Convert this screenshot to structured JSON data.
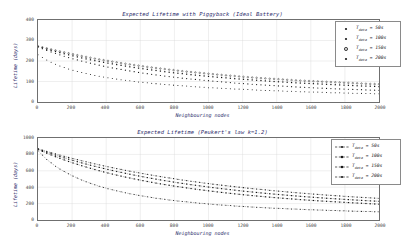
{
  "figure": {
    "background": "#ffffff",
    "axis_color": "#6f6f6f",
    "title_color": "#2b2b6b",
    "marker_color": "#1a1a1a"
  },
  "panels": [
    {
      "id": "top",
      "title": "Expected Lifetime with Piggyback (Ideal Battery)",
      "xlabel": "Neighbouring nodes",
      "ylabel": "Lifetime (days)",
      "yticks": [
        "400",
        "300",
        "200",
        "100",
        "0"
      ],
      "xticks": [
        "0",
        "200",
        "400",
        "600",
        "800",
        "1000",
        "1200",
        "1400",
        "1600",
        "1800",
        "2000"
      ],
      "legend": [
        {
          "label": "T",
          "sub": "data",
          "value": "= 50s",
          "style": "marker"
        },
        {
          "label": "T",
          "sub": "data",
          "value": "= 100s",
          "style": "marker"
        },
        {
          "label": "T",
          "sub": "data",
          "value": "= 150s",
          "style": "marker"
        },
        {
          "label": "T",
          "sub": "data",
          "value": "= 200s",
          "style": "marker"
        }
      ]
    },
    {
      "id": "bottom",
      "title": "Expected Lifetime (Peukert's law k=1.2)",
      "xlabel": "Neighbouring nodes",
      "ylabel": "Lifetime (days)",
      "yticks": [
        "1000",
        "800",
        "600",
        "400",
        "200",
        "0"
      ],
      "xticks": [
        "0",
        "200",
        "400",
        "600",
        "800",
        "1000",
        "1200",
        "1400",
        "1600",
        "1800",
        "2000"
      ],
      "legend": [
        {
          "label": "T",
          "sub": "data",
          "value": "= 50s",
          "style": "dashed-marker"
        },
        {
          "label": "T",
          "sub": "data",
          "value": "= 100s",
          "style": "dashed-marker"
        },
        {
          "label": "T",
          "sub": "data",
          "value": "= 150s",
          "style": "dashed-marker"
        },
        {
          "label": "T",
          "sub": "data",
          "value": "= 200s",
          "style": "dashed-marker"
        }
      ]
    }
  ],
  "chart_data": [
    {
      "type": "scatter",
      "title": "Expected Lifetime with Piggyback (Ideal Battery)",
      "xlabel": "Neighbouring nodes",
      "ylabel": "Lifetime (days)",
      "xlim": [
        0,
        2000
      ],
      "ylim": [
        0,
        400
      ],
      "xticks": [
        0,
        200,
        400,
        600,
        800,
        1000,
        1200,
        1400,
        1600,
        1800,
        2000
      ],
      "yticks": [
        0,
        100,
        200,
        300,
        400
      ],
      "grid": true,
      "legend_position": "upper right",
      "x": [
        0,
        50,
        100,
        150,
        200,
        250,
        300,
        350,
        400,
        450,
        500,
        550,
        600,
        650,
        700,
        750,
        800,
        850,
        900,
        950,
        1000,
        1050,
        1100,
        1150,
        1200,
        1250,
        1300,
        1350,
        1400,
        1450,
        1500,
        1550,
        1600,
        1650,
        1700,
        1750,
        1800,
        1850,
        1900,
        1950,
        2000
      ],
      "series": [
        {
          "name": "T_data = 50s",
          "values": [
            268,
            252,
            238,
            224,
            212,
            201,
            191,
            181,
            172,
            164,
            157,
            150,
            143,
            137,
            131,
            126,
            121,
            116,
            112,
            108,
            104,
            100,
            97,
            93,
            90,
            87,
            84,
            82,
            79,
            77,
            74,
            72,
            70,
            68,
            66,
            64,
            63,
            61,
            60,
            58,
            57
          ]
        },
        {
          "name": "T_data = 100s",
          "values": [
            270,
            258,
            247,
            236,
            226,
            216,
            207,
            199,
            191,
            184,
            177,
            170,
            164,
            158,
            153,
            147,
            142,
            138,
            133,
            129,
            125,
            121,
            118,
            114,
            111,
            108,
            105,
            102,
            99,
            97,
            94,
            92,
            90,
            88,
            86,
            84,
            82,
            80,
            78,
            77,
            75
          ]
        },
        {
          "name": "T_data = 150s",
          "values": [
            272,
            262,
            252,
            243,
            234,
            225,
            217,
            209,
            202,
            195,
            188,
            182,
            176,
            170,
            165,
            160,
            155,
            150,
            146,
            142,
            138,
            134,
            130,
            127,
            123,
            120,
            117,
            114,
            112,
            109,
            106,
            104,
            102,
            100,
            98,
            96,
            94,
            92,
            90,
            88,
            87
          ]
        },
        {
          "name": "T_data = 200s",
          "values": [
            230,
            205,
            185,
            169,
            156,
            145,
            135,
            127,
            120,
            113,
            107,
            102,
            97,
            93,
            89,
            85,
            82,
            79,
            76,
            73,
            70,
            68,
            66,
            64,
            62,
            60,
            58,
            56,
            55,
            53,
            52,
            50,
            49,
            48,
            46,
            45,
            44,
            43,
            42,
            41,
            40
          ]
        }
      ]
    },
    {
      "type": "line",
      "title": "Expected Lifetime (Peukert's law k=1.2)",
      "xlabel": "Neighbouring nodes",
      "ylabel": "Lifetime (days)",
      "xlim": [
        0,
        2000
      ],
      "ylim": [
        0,
        1000
      ],
      "xticks": [
        0,
        200,
        400,
        600,
        800,
        1000,
        1200,
        1400,
        1600,
        1800,
        2000
      ],
      "yticks": [
        0,
        200,
        400,
        600,
        800,
        1000
      ],
      "grid": true,
      "legend_position": "upper right",
      "x": [
        0,
        50,
        100,
        150,
        200,
        250,
        300,
        350,
        400,
        450,
        500,
        550,
        600,
        650,
        700,
        750,
        800,
        850,
        900,
        950,
        1000,
        1050,
        1100,
        1150,
        1200,
        1250,
        1300,
        1350,
        1400,
        1450,
        1500,
        1550,
        1600,
        1650,
        1700,
        1750,
        1800,
        1850,
        1900,
        1950,
        2000
      ],
      "series": [
        {
          "name": "T_data = 50s",
          "values": [
            870,
            838,
            808,
            779,
            752,
            726,
            701,
            677,
            654,
            632,
            611,
            591,
            572,
            553,
            536,
            519,
            503,
            487,
            472,
            458,
            444,
            431,
            419,
            407,
            395,
            384,
            374,
            364,
            354,
            345,
            336,
            327,
            319,
            311,
            303,
            296,
            289,
            282,
            276,
            270,
            264
          ]
        },
        {
          "name": "T_data = 100s",
          "values": [
            865,
            828,
            793,
            760,
            729,
            700,
            672,
            646,
            621,
            597,
            575,
            553,
            533,
            514,
            495,
            478,
            461,
            445,
            430,
            416,
            402,
            389,
            377,
            365,
            353,
            343,
            332,
            322,
            313,
            304,
            295,
            287,
            279,
            272,
            264,
            258,
            251,
            245,
            239,
            233,
            228
          ]
        },
        {
          "name": "T_data = 150s",
          "values": [
            860,
            815,
            774,
            735,
            699,
            666,
            635,
            606,
            578,
            553,
            529,
            507,
            486,
            466,
            447,
            430,
            413,
            398,
            383,
            369,
            356,
            343,
            331,
            320,
            309,
            299,
            289,
            280,
            271,
            263,
            255,
            247,
            240,
            233,
            227,
            221,
            215,
            209,
            204,
            198,
            193
          ]
        },
        {
          "name": "T_data = 200s",
          "values": [
            845,
            740,
            660,
            595,
            540,
            493,
            453,
            418,
            388,
            361,
            337,
            316,
            297,
            280,
            264,
            250,
            237,
            226,
            215,
            205,
            196,
            187,
            180,
            172,
            166,
            159,
            153,
            148,
            143,
            138,
            134,
            129,
            125,
            122,
            118,
            115,
            111,
            108,
            105,
            103,
            100
          ]
        }
      ]
    }
  ]
}
